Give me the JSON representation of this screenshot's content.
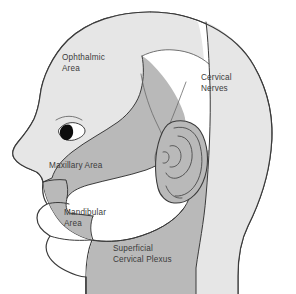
{
  "figure": {
    "kind": "anatomical-diagram",
    "view": "left lateral profile, facing left",
    "background_color": "#ffffff",
    "outline_color": "#3a3a3a"
  },
  "palette": {
    "region_light": "#e6e6e6",
    "region_dark": "#b9b9b9",
    "region_white": "#ffffff",
    "outline": "#3a3a3a",
    "label_text": "#3b3b3b",
    "eye_pupil": "#0d0d0d"
  },
  "labels": {
    "ophthalmic": {
      "line1": "Ophthalmic",
      "line2": "Area"
    },
    "cervical_nerves": {
      "line1": "Cervical",
      "line2": "Nerves"
    },
    "maxillary": {
      "line1": "Maxillary Area"
    },
    "mandibular": {
      "line1": "Mandibular",
      "line2": "Area"
    },
    "superficial_cervical_plexus": {
      "line1": "Superficial",
      "line2": "Cervical Plexus"
    }
  },
  "regions": [
    {
      "id": "ophthalmic-area",
      "name": "Ophthalmic Area",
      "shade": "light",
      "shade_hex": "#e6e6e6"
    },
    {
      "id": "maxillary-area",
      "name": "Maxillary Area",
      "shade": "dark",
      "shade_hex": "#b9b9b9"
    },
    {
      "id": "mandibular-area",
      "name": "Mandibular Area",
      "shade": "white",
      "shade_hex": "#ffffff"
    },
    {
      "id": "superficial-cervical-plexus",
      "name": "Superficial Cervical Plexus",
      "shade": "dark",
      "shade_hex": "#b9b9b9"
    },
    {
      "id": "cervical-nerves",
      "name": "Cervical Nerves",
      "shade": "light",
      "shade_hex": "#e6e6e6"
    }
  ],
  "features": [
    {
      "id": "eye",
      "name": "eye"
    },
    {
      "id": "ear",
      "name": "ear"
    },
    {
      "id": "nose",
      "name": "nose profile"
    },
    {
      "id": "lips",
      "name": "lips"
    },
    {
      "id": "neck",
      "name": "neck"
    }
  ]
}
